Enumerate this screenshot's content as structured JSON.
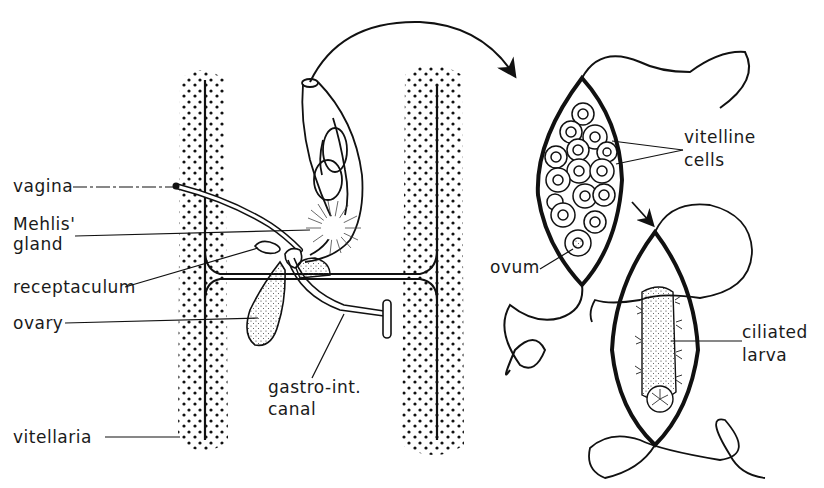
{
  "diagram": {
    "colors": {
      "ink": "#111111",
      "background": "#ffffff"
    },
    "labels": {
      "vagina": "vagina",
      "mehlis_gland_line1": "Mehlis'",
      "mehlis_gland_line2": "gland",
      "receptaculum": "receptaculum",
      "ovary": "ovary",
      "vitellaria": "vitellaria",
      "gastro_int_line1": "gastro-int.",
      "gastro_int_line2": "canal",
      "vitelline_cells_line1": "vitelline",
      "vitelline_cells_line2": "cells",
      "ovum": "ovum",
      "ciliated_larva_line1": "ciliated",
      "ciliated_larva_line2": "larva"
    }
  }
}
